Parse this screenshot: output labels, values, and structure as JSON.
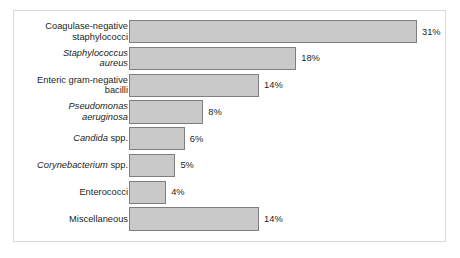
{
  "chart_data": {
    "type": "bar",
    "orientation": "horizontal",
    "title": "",
    "xlabel": "",
    "ylabel": "",
    "xlim": [
      0,
      31
    ],
    "grid": false,
    "legend": null,
    "value_suffix": "%",
    "categories": [
      "Coagulase-negative staphylococci",
      "Staphylococcus aureus",
      "Enteric gram-negative bacilli",
      "Pseudomonas aeruginosa",
      "Candida spp.",
      "Corynebacterium spp.",
      "Enterococci",
      "Miscellaneous"
    ],
    "values": [
      31,
      18,
      14,
      8,
      6,
      5,
      4,
      14
    ],
    "value_labels": [
      "31%",
      "18%",
      "14%",
      "8%",
      "6%",
      "5%",
      "4%",
      "14%"
    ],
    "bars": [
      {
        "label_lines": [
          {
            "text": "Coagulase-negative",
            "italic": false
          },
          {
            "text": "staphylococci",
            "italic": false
          }
        ],
        "value": 31,
        "value_label": "31%"
      },
      {
        "label_lines": [
          {
            "text": "Staphylococcus",
            "italic": true
          },
          {
            "text": "aureus",
            "italic": true
          }
        ],
        "value": 18,
        "value_label": "18%"
      },
      {
        "label_lines": [
          {
            "text": "Enteric gram-negative",
            "italic": false
          },
          {
            "text": "bacilli",
            "italic": false
          }
        ],
        "value": 14,
        "value_label": "14%"
      },
      {
        "label_lines": [
          {
            "text": "Pseudomonas",
            "italic": true
          },
          {
            "text": "aeruginosa",
            "italic": true
          }
        ],
        "value": 8,
        "value_label": "8%"
      },
      {
        "label_lines": [
          {
            "text": "Candida",
            "italic": true
          },
          {
            "text": " spp.",
            "italic": false
          }
        ],
        "single_line": true,
        "value": 6,
        "value_label": "6%"
      },
      {
        "label_lines": [
          {
            "text": "Corynebacterium",
            "italic": true
          },
          {
            "text": " spp.",
            "italic": false
          }
        ],
        "single_line": true,
        "value": 5,
        "value_label": "5%"
      },
      {
        "label_lines": [
          {
            "text": "Enterococci",
            "italic": false
          }
        ],
        "single_line": true,
        "value": 4,
        "value_label": "4%"
      },
      {
        "label_lines": [
          {
            "text": "Miscellaneous",
            "italic": false
          }
        ],
        "single_line": true,
        "value": 14,
        "value_label": "14%"
      }
    ],
    "colors": {
      "bar_fill": "#c9c9c9",
      "bar_stroke": "#7f7f7f",
      "frame_stroke": "#d9d9d9",
      "text": "#231f20",
      "background": "#ffffff"
    }
  }
}
